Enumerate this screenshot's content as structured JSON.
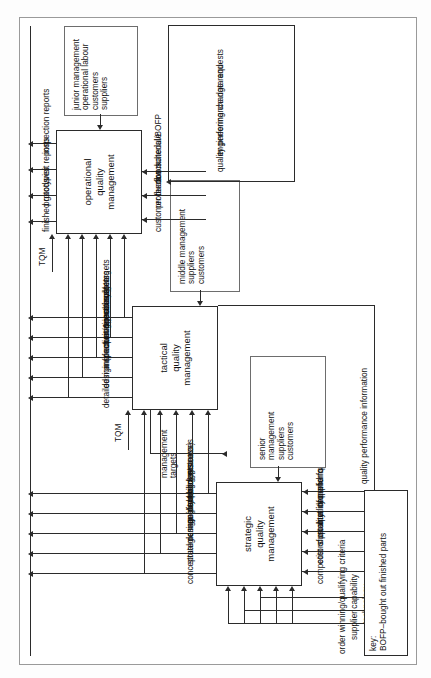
{
  "diagram": {
    "orientation": "rotated-90-ccw",
    "ink_color": "#2b2b2b",
    "paper_color": "#ffffff"
  },
  "levels": [
    {
      "id": "strategic",
      "label": "strategic\nquality\nmanagement"
    },
    {
      "id": "tactical",
      "label": "tactical\nquality\nmanagement"
    },
    {
      "id": "operational",
      "label": "operational\nquality\nmanagement"
    }
  ],
  "boxes": {
    "strategic": {
      "line1": "strategic",
      "line2": "quality",
      "line3": "management"
    },
    "tactical": {
      "line1": "tactical",
      "line2": "quality",
      "line3": "management"
    },
    "operational": {
      "line1": "operational",
      "line2": "quality",
      "line3": "management"
    }
  },
  "actors": {
    "senior": {
      "lines": [
        "senior",
        "management",
        "suppliers",
        "customers"
      ]
    },
    "middle": {
      "lines": [
        "middle management",
        "suppliers",
        "customers"
      ]
    },
    "junior": {
      "lines": [
        "junior management",
        "operational labour",
        "customers",
        "suppliers"
      ]
    }
  },
  "strategic_inputs_top": [
    "order winning/qualifying criteria",
    "supplier capability",
    "technology",
    "TQM"
  ],
  "strategic_inputs_left": [
    "internal capability",
    "business policy"
  ],
  "strategic_inputs_bottom": [
    "competitors product info",
    "cost of quality",
    "customer demand for quality",
    "quality performance info",
    "supplier quality info"
  ],
  "strategic_outputs": [
    "conceptual design (product & process)",
    "strategic manufacturing resources",
    "management budgets",
    "quality policies",
    "design systems"
  ],
  "tactical_inputs": [
    "TQM"
  ],
  "tactical_outputs": [
    "detailed manufacturing resources",
    "design (product & process)",
    "inspection/rejects systems",
    "operational budgets",
    "operational targets"
  ],
  "tactical_to_strategic": "management targets",
  "operational_inputs_bottom": [
    "customer feedback",
    "production schedule",
    "raw material/BOFP"
  ],
  "operational_inputs_top": [
    "TQM"
  ],
  "operational_outputs": [
    "finished goods",
    "prototypes",
    "visit reports",
    "inspection reports"
  ],
  "feedback_lines": [
    "quality performance information",
    "quality performance data and",
    "engineering change requests"
  ],
  "key": {
    "heading": "key:",
    "entry": "BOFP–bought out finished parts"
  }
}
